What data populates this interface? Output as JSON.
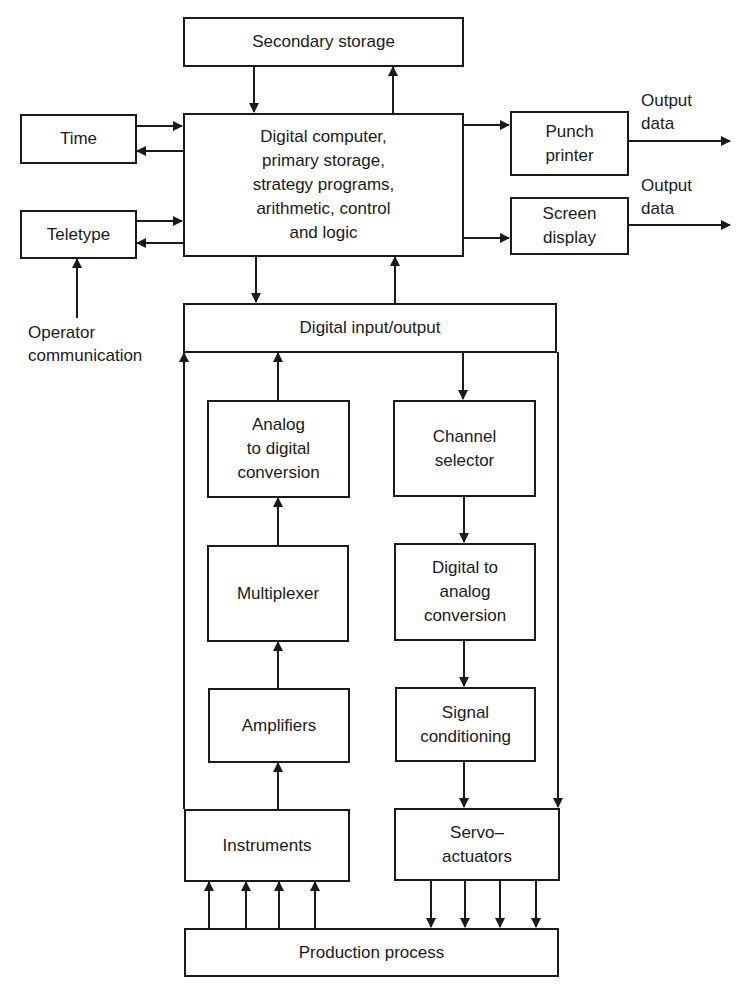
{
  "diagram": {
    "boxes": {
      "secondary_storage": "Secondary storage",
      "time": "Time",
      "teletype": "Teletype",
      "digital_computer": "Digital computer,\nprimary storage,\nstrategy programs,\narithmetic, control\nand logic",
      "punch_printer": "Punch\nprinter",
      "screen_display": "Screen\ndisplay",
      "digital_io": "Digital input/output",
      "adc": "Analog\nto digital\nconversion",
      "channel_selector": "Channel\nselector",
      "multiplexer": "Multiplexer",
      "dac": "Digital to\nanalog\nconversion",
      "amplifiers": "Amplifiers",
      "signal_conditioning": "Signal\nconditioning",
      "instruments": "Instruments",
      "servo_actuators": "Servo–\nactuators",
      "production_process": "Production process"
    },
    "labels": {
      "output_data_1": "Output\ndata",
      "output_data_2": "Output\ndata",
      "operator_communication": "Operator\ncommunication"
    },
    "line_color": "#1a1a1a"
  }
}
